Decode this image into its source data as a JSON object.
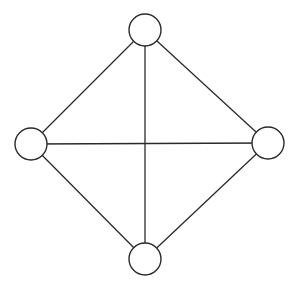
{
  "diagram": {
    "type": "graph",
    "nodes": [
      {
        "id": "top",
        "cx": 145,
        "cy": 30,
        "r": 16
      },
      {
        "id": "left",
        "cx": 31,
        "cy": 144,
        "r": 16
      },
      {
        "id": "right",
        "cx": 268,
        "cy": 143,
        "r": 16
      },
      {
        "id": "bottom",
        "cx": 145,
        "cy": 259,
        "r": 16
      }
    ],
    "edges": [
      [
        "top",
        "left"
      ],
      [
        "top",
        "right"
      ],
      [
        "top",
        "bottom"
      ],
      [
        "left",
        "right"
      ],
      [
        "left",
        "bottom"
      ],
      [
        "right",
        "bottom"
      ]
    ],
    "colors": {
      "stroke": "#2a2a2a",
      "fill": "#ffffff",
      "background": "#ffffff"
    }
  }
}
